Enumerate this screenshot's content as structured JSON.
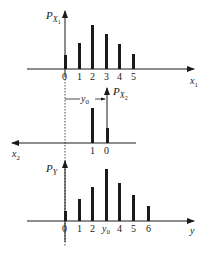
{
  "diagram": {
    "top_panel": {
      "y_label": "P",
      "y_label_sub": "X",
      "y_label_subsub": "1",
      "x_label": "x",
      "x_label_sub": "1",
      "ticks": [
        "0",
        "1",
        "2",
        "3",
        "4",
        "5"
      ],
      "bar_heights_px": [
        15,
        27,
        45,
        36,
        26,
        16
      ]
    },
    "middle_panel": {
      "y_label": "P",
      "y_label_sub": "X",
      "y_label_subsub": "2",
      "x_label": "x",
      "x_label_sub": "2",
      "shift_label": "y",
      "shift_label_sub": "0",
      "ticks": [
        "1",
        "0"
      ],
      "bar_heights_px": [
        35,
        15
      ]
    },
    "bottom_panel": {
      "y_label": "P",
      "y_label_sub": "Y",
      "x_label": "y",
      "ticks": [
        "0",
        "1",
        "2",
        "y0",
        "4",
        "5",
        "6"
      ],
      "tick_y0_main": "y",
      "tick_y0_sub": "0",
      "bar_heights_px": [
        10,
        22,
        34,
        52,
        38,
        26,
        15
      ]
    }
  },
  "colors": {
    "ink": "#1a1a1a",
    "background": "#ffffff"
  }
}
